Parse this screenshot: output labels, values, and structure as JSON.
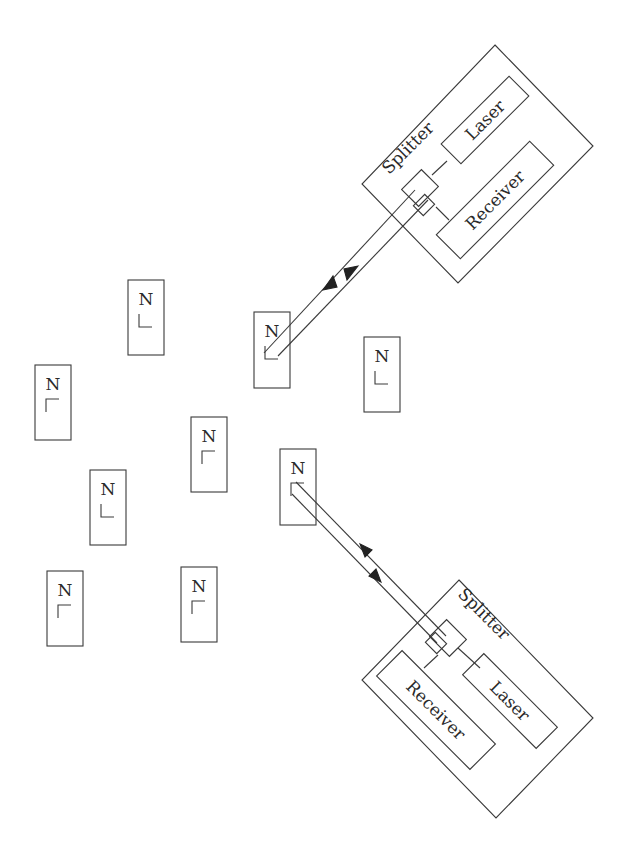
{
  "diagram": {
    "title": "",
    "stroke_color": "#3a3a3a",
    "background": "#ffffff",
    "nodes": [
      {
        "id": "node-1",
        "label": "N",
        "x": 128,
        "y": 280,
        "w": 36,
        "h": 75,
        "corner": "bottom-left"
      },
      {
        "id": "node-2",
        "label": "N",
        "x": 35,
        "y": 365,
        "w": 36,
        "h": 75,
        "corner": "top-left"
      },
      {
        "id": "node-3",
        "label": "N",
        "x": 254,
        "y": 312,
        "w": 36,
        "h": 76,
        "corner": "bottom-left",
        "linked_to": "transceiver-top"
      },
      {
        "id": "node-4",
        "label": "N",
        "x": 364,
        "y": 337,
        "w": 36,
        "h": 75,
        "corner": "bottom-left"
      },
      {
        "id": "node-5",
        "label": "N",
        "x": 191,
        "y": 417,
        "w": 36,
        "h": 75,
        "corner": "top-left"
      },
      {
        "id": "node-6",
        "label": "N",
        "x": 280,
        "y": 449,
        "w": 36,
        "h": 76,
        "corner": "top-left",
        "linked_to": "transceiver-bottom"
      },
      {
        "id": "node-7",
        "label": "N",
        "x": 90,
        "y": 470,
        "w": 36,
        "h": 75,
        "corner": "bottom-left"
      },
      {
        "id": "node-8",
        "label": "N",
        "x": 47,
        "y": 571,
        "w": 36,
        "h": 75,
        "corner": "top-left"
      },
      {
        "id": "node-9",
        "label": "N",
        "x": 181,
        "y": 567,
        "w": 36,
        "h": 75,
        "corner": "top-left"
      }
    ],
    "transceivers": [
      {
        "id": "transceiver-top",
        "housing": [
          [
            495,
            45
          ],
          [
            593,
            146
          ],
          [
            458,
            283
          ],
          [
            362,
            184
          ]
        ],
        "splitter_label": "Splitter",
        "laser_label": "Laser",
        "receiver_label": "Receiver"
      },
      {
        "id": "transceiver-bottom",
        "housing": [
          [
            459,
            580
          ],
          [
            593,
            718
          ],
          [
            496,
            818
          ],
          [
            362,
            680
          ]
        ],
        "splitter_label": "Splitter",
        "laser_label": "Laser",
        "receiver_label": "Receiver"
      }
    ],
    "links": [
      {
        "from": "transceiver-top",
        "to": "node-3",
        "direction": "bidirectional"
      },
      {
        "from": "transceiver-bottom",
        "to": "node-6",
        "direction": "bidirectional"
      }
    ]
  }
}
